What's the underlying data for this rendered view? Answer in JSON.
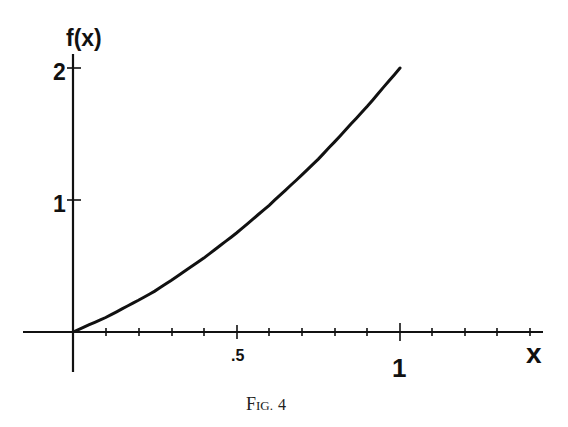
{
  "chart_data": {
    "type": "line",
    "title": "",
    "caption": "Fig. 4",
    "xlabel": "x",
    "ylabel": "f(x)",
    "xlim": [
      -0.31,
      0.87
    ],
    "ylim": [
      -0.3,
      2.1
    ],
    "x_ticks": [
      {
        "value": 0.1,
        "label": ""
      },
      {
        "value": 0.2,
        "label": ""
      },
      {
        "value": 0.3,
        "label": ""
      },
      {
        "value": 0.4,
        "label": ""
      },
      {
        "value": 0.5,
        "label": ".5"
      },
      {
        "value": 0.6,
        "label": ""
      },
      {
        "value": 0.7,
        "label": ""
      },
      {
        "value": 0.8,
        "label": ""
      },
      {
        "value": 0.9,
        "label": ""
      },
      {
        "value": 1.0,
        "label": "1"
      },
      {
        "value": 1.1,
        "label": ""
      },
      {
        "value": 1.2,
        "label": ""
      },
      {
        "value": 1.3,
        "label": ""
      },
      {
        "value": 1.4,
        "label": ""
      }
    ],
    "y_ticks": [
      {
        "value": 1,
        "label": "1"
      },
      {
        "value": 2,
        "label": "2"
      }
    ],
    "grid": false,
    "legend": null,
    "series": [
      {
        "name": "f(x)",
        "x": [
          0,
          0.1,
          0.2,
          0.25,
          0.3,
          0.4,
          0.5,
          0.6,
          0.7,
          0.75,
          0.8,
          0.9,
          1.0
        ],
        "y": [
          0,
          0.11,
          0.24,
          0.31,
          0.39,
          0.56,
          0.75,
          0.96,
          1.19,
          1.31,
          1.44,
          1.71,
          2.0
        ]
      }
    ]
  },
  "labels": {
    "y_axis": "f(x)",
    "x_axis": "x",
    "y_tick_1": "1",
    "y_tick_2": "2",
    "x_tick_half": ".5",
    "x_tick_one": "1",
    "caption_main": "F",
    "caption_rest": "IG.",
    "caption_num": "4"
  }
}
